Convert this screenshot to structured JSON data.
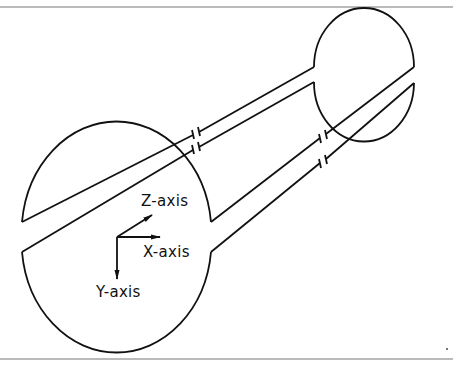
{
  "diagram": {
    "type": "coordinate-axes-schematic",
    "labels": {
      "z_axis": "Z-axis",
      "x_axis": "X-axis",
      "y_axis": "Y-axis"
    },
    "colors": {
      "stroke": "#111111",
      "background": "#ffffff",
      "rule": "#777777"
    },
    "shapes": {
      "large_body": {
        "cx": 116,
        "cy": 238,
        "rx": 95,
        "ry": 112
      },
      "small_body": {
        "cx": 364,
        "cy": 75,
        "rx": 50,
        "ry": 59
      }
    }
  }
}
